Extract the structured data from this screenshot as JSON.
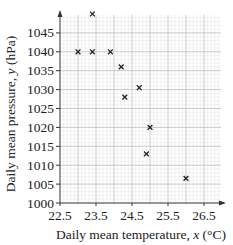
{
  "chart_data": {
    "type": "scatter",
    "title": "",
    "xlabel": "Daily mean temperature, x (°C)",
    "ylabel": "Daily mean pressure, y (hPa)",
    "xlim": [
      22.5,
      26.9
    ],
    "ylim": [
      1000,
      1050.5
    ],
    "x_ticks": [
      22.5,
      23.5,
      24.5,
      25.5,
      26.5
    ],
    "x_tick_labels": [
      "22.5",
      "23.5",
      "24.5",
      "25.5",
      "26.5"
    ],
    "y_ticks": [
      1000,
      1005,
      1010,
      1015,
      1020,
      1025,
      1030,
      1035,
      1040,
      1045
    ],
    "y_tick_labels": [
      "1000",
      "1005",
      "1010",
      "1015",
      "1020",
      "1025",
      "1030",
      "1035",
      "1040",
      "1045"
    ],
    "grid": true,
    "marker": "x",
    "legend": null,
    "points": [
      {
        "x": 23.0,
        "y": 1040
      },
      {
        "x": 23.4,
        "y": 1040
      },
      {
        "x": 23.4,
        "y": 1050
      },
      {
        "x": 23.9,
        "y": 1040
      },
      {
        "x": 24.2,
        "y": 1036
      },
      {
        "x": 24.3,
        "y": 1028
      },
      {
        "x": 24.7,
        "y": 1030.5
      },
      {
        "x": 24.9,
        "y": 1013
      },
      {
        "x": 25.0,
        "y": 1020
      },
      {
        "x": 26.0,
        "y": 1006.5
      }
    ]
  },
  "axes": {
    "x_label_text": "Daily mean temperature, ",
    "x_label_var": "x",
    "x_label_unit": " (°C)",
    "y_label_text": "Daily mean pressure, ",
    "y_label_var": "y",
    "y_label_unit": " (hPa)"
  },
  "colors": {
    "axis": "#333333",
    "grid_minor": "#e4e4e4",
    "grid_major": "#bdbdbd",
    "marker": "#222222"
  }
}
